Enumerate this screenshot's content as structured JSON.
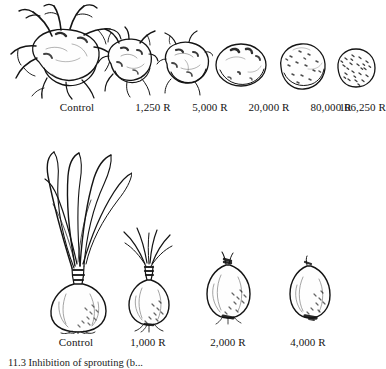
{
  "figure": {
    "kind": "scientific-illustration",
    "caption": "11.3  Inhibition of sprouting (b...",
    "caption_number": "11.3"
  },
  "rows": [
    {
      "id": "potatoes",
      "commodity": "potato",
      "specimens": [
        {
          "label": "Control",
          "dose": "0 R",
          "sprouting": "heavy long sprouts",
          "size": 1.0,
          "sprout_level": 5
        },
        {
          "label": "1,250 R",
          "dose": "1,250 R",
          "sprouting": "many short sprouts",
          "size": 0.62,
          "sprout_level": 4
        },
        {
          "label": "5,000 R",
          "dose": "5,000 R",
          "sprouting": "few stubby sprouts",
          "size": 0.55,
          "sprout_level": 3
        },
        {
          "label": "20,000 R",
          "dose": "20,000 R",
          "sprouting": "dormant eyes only",
          "size": 0.5,
          "sprout_level": 1
        },
        {
          "label": "80,000 R",
          "dose": "80,000 R",
          "sprouting": "no sprouts",
          "size": 0.46,
          "sprout_level": 0
        },
        {
          "label": "106,250 R",
          "dose": "106,250 R",
          "sprouting": "no sprouts, shrivelled",
          "size": 0.4,
          "sprout_level": 0
        }
      ]
    },
    {
      "id": "onions",
      "commodity": "onion",
      "specimens": [
        {
          "label": "Control",
          "dose": "0 R",
          "sprouting": "long green shoots",
          "size": 1.0,
          "sprout_level": 5
        },
        {
          "label": "1,000 R",
          "dose": "1,000 R",
          "sprouting": "short shoots",
          "size": 0.8,
          "sprout_level": 3
        },
        {
          "label": "2,000 R",
          "dose": "2,000 R",
          "sprouting": "minimal neck growth",
          "size": 0.68,
          "sprout_level": 1
        },
        {
          "label": "4,000 R",
          "dose": "4,000 R",
          "sprouting": "no sprouting",
          "size": 0.6,
          "sprout_level": 0
        }
      ]
    }
  ],
  "colors": {
    "ink": "#141414",
    "paper": "#ffffff",
    "shade": "#4a4a4a"
  }
}
